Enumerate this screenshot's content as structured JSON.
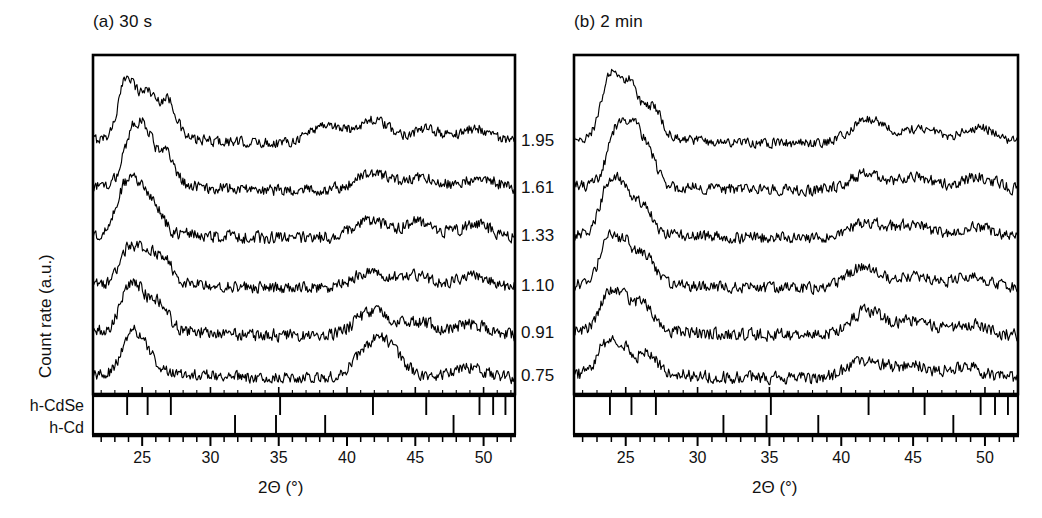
{
  "figure": {
    "panels": [
      {
        "id": "panel-a",
        "title": "(a) 30 s",
        "xlabel": "2Θ (°)",
        "ylabel": "Count rate (a.u.)"
      },
      {
        "id": "panel-b",
        "title": "(b) 2 min",
        "xlabel": "2Θ (°)",
        "ylabel": ""
      }
    ],
    "offset_labels": [
      "1.95",
      "1.61",
      "1.33",
      "1.10",
      "0.91",
      "0.75"
    ],
    "phase_labels": [
      "h-CdSe",
      "h-Cd"
    ],
    "xtick_labels": [
      "25",
      "30",
      "35",
      "40",
      "45",
      "50"
    ]
  },
  "chart_data": {
    "type": "line",
    "title": "",
    "xlabel": "2Θ (°)",
    "ylabel": "Count rate (a.u.)",
    "xlim": [
      21.4,
      52.3
    ],
    "xticks": [
      25,
      30,
      35,
      40,
      45,
      50
    ],
    "xminortick_step": 1,
    "grid": false,
    "legend": "none",
    "stacked_offset_axis": {
      "position": "between-panels",
      "values": [
        1.95,
        1.61,
        1.33,
        1.1,
        0.91,
        0.75
      ],
      "meaning": "curve offset labels (stacked traces, top to bottom)"
    },
    "panels": [
      {
        "name": "(a) 30 s",
        "series": [
          {
            "name": "1.95",
            "peaks": [
              23.9,
              25.4,
              26.9,
              38.4,
              41.9,
              45.8,
              49.5
            ],
            "peak_heights": [
              1.0,
              0.72,
              0.62,
              0.3,
              0.38,
              0.22,
              0.24
            ],
            "noise": 0.09,
            "baseline": 0.0
          },
          {
            "name": "1.61",
            "peaks": [
              24.2,
              25.3,
              26.8,
              41.8,
              45.5,
              49.8
            ],
            "peak_heights": [
              0.78,
              0.8,
              0.5,
              0.28,
              0.22,
              0.2
            ],
            "noise": 0.1,
            "baseline": 0.0
          },
          {
            "name": "1.33",
            "peaks": [
              23.6,
              24.6,
              25.8,
              41.6,
              45.3,
              49.4
            ],
            "peak_heights": [
              0.62,
              0.66,
              0.48,
              0.3,
              0.26,
              0.22
            ],
            "noise": 0.11,
            "baseline": 0.0
          },
          {
            "name": "1.10",
            "peaks": [
              24.0,
              25.3,
              26.6,
              41.7,
              45.0,
              49.2
            ],
            "peak_heights": [
              0.55,
              0.5,
              0.4,
              0.28,
              0.2,
              0.2
            ],
            "noise": 0.1,
            "baseline": 0.0
          },
          {
            "name": "0.91",
            "peaks": [
              23.9,
              24.9,
              26.3,
              41.9,
              45.2,
              49.0
            ],
            "peak_heights": [
              0.58,
              0.52,
              0.42,
              0.4,
              0.22,
              0.18
            ],
            "noise": 0.11,
            "baseline": 0.0
          },
          {
            "name": "0.75",
            "peaks": [
              24.1,
              25.2,
              41.8,
              43.0,
              48.8
            ],
            "peak_heights": [
              0.6,
              0.4,
              0.42,
              0.34,
              0.18
            ],
            "noise": 0.1,
            "baseline": 0.0
          }
        ]
      },
      {
        "name": "(b) 2 min",
        "series": [
          {
            "name": "1.95",
            "peaks": [
              23.9,
              25.3,
              26.9,
              41.9,
              45.5,
              49.6
            ],
            "peak_heights": [
              1.0,
              0.88,
              0.5,
              0.4,
              0.24,
              0.26
            ],
            "noise": 0.08,
            "baseline": 0.0
          },
          {
            "name": "1.61",
            "peaks": [
              24.3,
              25.4,
              26.5,
              41.7,
              45.2,
              49.5
            ],
            "peak_heights": [
              0.8,
              0.82,
              0.52,
              0.26,
              0.22,
              0.22
            ],
            "noise": 0.1,
            "baseline": 0.0
          },
          {
            "name": "1.33",
            "peaks": [
              23.8,
              24.8,
              26.2,
              41.8,
              45.0,
              49.3
            ],
            "peak_heights": [
              0.72,
              0.62,
              0.44,
              0.26,
              0.22,
              0.2
            ],
            "noise": 0.1,
            "baseline": 0.0
          },
          {
            "name": "1.10",
            "peaks": [
              23.8,
              25.0,
              26.4,
              41.6,
              45.2,
              49.0
            ],
            "peak_heights": [
              0.68,
              0.58,
              0.42,
              0.34,
              0.2,
              0.18
            ],
            "noise": 0.1,
            "baseline": 0.0
          },
          {
            "name": "0.91",
            "peaks": [
              23.7,
              24.9,
              26.3,
              41.8,
              45.1,
              48.8
            ],
            "peak_heights": [
              0.52,
              0.48,
              0.4,
              0.4,
              0.22,
              0.18
            ],
            "noise": 0.11,
            "baseline": 0.0
          },
          {
            "name": "0.75",
            "peaks": [
              23.6,
              24.8,
              26.5,
              41.7,
              44.9,
              48.6
            ],
            "peak_heights": [
              0.46,
              0.4,
              0.34,
              0.3,
              0.2,
              0.18
            ],
            "noise": 0.11,
            "baseline": 0.0
          }
        ]
      }
    ],
    "reference_lines": {
      "h-CdSe": [
        23.9,
        25.4,
        27.1,
        35.1,
        41.9,
        45.8,
        49.7,
        50.7,
        51.6
      ],
      "h-Cd": [
        31.8,
        34.8,
        38.4,
        47.8
      ]
    }
  }
}
